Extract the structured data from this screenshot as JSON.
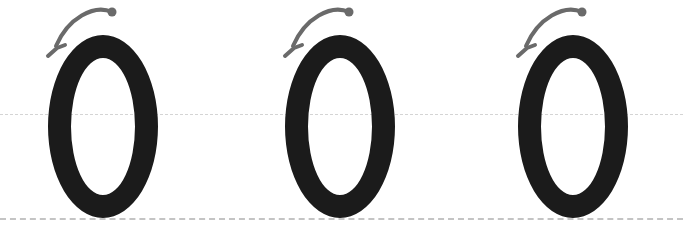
{
  "worksheet": {
    "title": "Letter O tracing practice",
    "background_color": "#ffffff",
    "width": 683,
    "height": 233,
    "letter": "O",
    "letter_count": 3,
    "instruction_alt": "Trace the letter O following the arrow, starting at the dot and moving counterclockwise."
  },
  "guidelines": {
    "midline": {
      "name": "dotted midline",
      "y": 114,
      "color": "#d4d4d4",
      "style": "dashed",
      "thickness": 1
    },
    "baseline": {
      "name": "baseline",
      "y": 218,
      "color": "#c4c4c4",
      "style": "dashed",
      "thickness": 2
    }
  },
  "glyph_style": {
    "color": "#1b1b1b",
    "stroke_width": 23,
    "width": 110,
    "height": 183,
    "top": 35
  },
  "arrow_style": {
    "color": "#6a6a6a",
    "stroke_width": 4,
    "dot_radius": 4.5,
    "direction": "counterclockwise"
  },
  "letters": [
    {
      "character": "O",
      "index": 1,
      "label": "letter-o-1",
      "left": 48,
      "arrow_label": "stroke direction arrow 1"
    },
    {
      "character": "O",
      "index": 2,
      "label": "letter-o-2",
      "left": 285,
      "arrow_label": "stroke direction arrow 2"
    },
    {
      "character": "O",
      "index": 3,
      "label": "letter-o-3",
      "left": 518,
      "arrow_label": "stroke direction arrow 3"
    }
  ]
}
